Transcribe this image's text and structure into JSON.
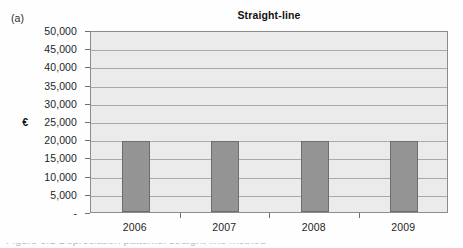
{
  "figure": {
    "panel_label": "(a)",
    "caption_partial": "Figure 5.1 Depreciation patterns: straight-line method"
  },
  "chart_data": {
    "type": "bar",
    "title": "Straight-line",
    "xlabel": "",
    "ylabel": "€",
    "categories": [
      "2006",
      "2007",
      "2008",
      "2009"
    ],
    "values": [
      19500,
      19500,
      19500,
      19500
    ],
    "series": [
      {
        "name": "Depreciation charge",
        "values": [
          19500,
          19500,
          19500,
          19500
        ]
      }
    ],
    "ylim": [
      0,
      50000
    ],
    "ytick_values": [
      0,
      5000,
      10000,
      15000,
      20000,
      25000,
      30000,
      35000,
      40000,
      45000,
      50000
    ],
    "ytick_labels": [
      "-",
      "5,000",
      "10,000",
      "15,000",
      "20,000",
      "25,000",
      "30,000",
      "35,000",
      "40,000",
      "45,000",
      "50,000"
    ],
    "grid": true,
    "legend": false,
    "legend_position": "none",
    "currency_symbol": "€",
    "currency_at_value": 25000,
    "colors": {
      "bar_fill": "#949494",
      "bar_border": "#6d6d6d",
      "plot_background": "#ebebeb",
      "gridline": "#a9a9a9",
      "axis_line": "#8c8c8c",
      "text": "#1e1e1e"
    }
  }
}
